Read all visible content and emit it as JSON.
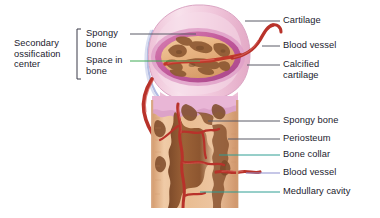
{
  "figure": {
    "type": "anatomical-diagram",
    "width": 380,
    "height": 218,
    "background": "#ffffff"
  },
  "palette": {
    "text": "#1b1b2e",
    "leader_gray": "#5a5a66",
    "leader_green": "#3faa54",
    "leader_teal": "#2f9e93",
    "leader_purple": "#8d8fd0",
    "cartilage_pink": "#f0c3d6",
    "cartilage_pink_light": "#f7dfe9",
    "calcified_magenta": "#c9629f",
    "spongy_tan": "#e8b483",
    "spongy_dark": "#9a6136",
    "bone_collar_tan": "#e3b893",
    "medullary_brown": "#8e5633",
    "vessel_red": "#c0392b",
    "vessel_red_dark": "#a32b22",
    "bracket": "#3a3a48"
  },
  "left_labels": {
    "group": {
      "name": "secondary-ossification-center",
      "text": "Secondary\nossification\ncenter",
      "x": 14,
      "y": 40
    },
    "items": [
      {
        "name": "spongy-bone-upper",
        "text": "Spongy\nbone",
        "x": 88,
        "y": 30,
        "leader_color": "#5a5a66",
        "leader": "gray"
      },
      {
        "name": "space-in-bone",
        "text": "Space in\nbone",
        "x": 88,
        "y": 55,
        "leader_color": "#3faa54",
        "leader": "green"
      }
    ]
  },
  "right_labels": [
    {
      "name": "cartilage",
      "text": "Cartilage",
      "x": 283,
      "y": 17,
      "leader_color": "#5a5a66",
      "leader": "gray"
    },
    {
      "name": "blood-vessel-upper",
      "text": "Blood vessel",
      "x": 283,
      "y": 42,
      "leader_color": "#5a5a66",
      "leader": "gray"
    },
    {
      "name": "calcified-cartilage",
      "text": "Calcified\ncartilage",
      "x": 283,
      "y": 60,
      "leader_color": "#5a5a66",
      "leader": "gray"
    },
    {
      "name": "spongy-bone-lower",
      "text": "Spongy bone",
      "x": 283,
      "y": 117,
      "leader_color": "#5a5a66",
      "leader": "gray"
    },
    {
      "name": "periosteum",
      "text": "Periosteum",
      "x": 283,
      "y": 135,
      "leader_color": "#5a5a66",
      "leader": "gray"
    },
    {
      "name": "bone-collar",
      "text": "Bone collar",
      "x": 283,
      "y": 151,
      "leader_color": "#2f9e93",
      "leader": "teal"
    },
    {
      "name": "blood-vessel-lower",
      "text": "Blood vessel",
      "x": 283,
      "y": 169,
      "leader_color": "#8d8fd0",
      "leader": "purple"
    },
    {
      "name": "medullary-cavity",
      "text": "Medullary cavity",
      "x": 283,
      "y": 188,
      "leader_color": "#2f9e93",
      "leader": "teal"
    }
  ],
  "structures": [
    {
      "name": "epiphysis",
      "label": "Epiphysis (cartilage cap)",
      "color": "#f0c3d6"
    },
    {
      "name": "calcified-cartilage-ring",
      "label": "Calcified cartilage",
      "color": "#c9629f"
    },
    {
      "name": "secondary-ossification-spongy-bone",
      "label": "Spongy bone (secondary center)",
      "color": "#e8b483"
    },
    {
      "name": "bone-collar-shaft",
      "label": "Bone collar",
      "color": "#e3b893"
    },
    {
      "name": "medullary-cavity-region",
      "label": "Medullary cavity",
      "color": "#8e5633"
    },
    {
      "name": "periosteum-layer",
      "label": "Periosteum",
      "color": "#d9a97f"
    },
    {
      "name": "blood-vessels",
      "label": "Blood vessels",
      "color": "#c0392b"
    }
  ]
}
